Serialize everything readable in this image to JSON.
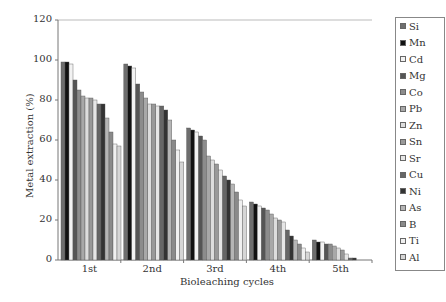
{
  "chart_data": {
    "type": "bar",
    "title": "",
    "xlabel": "Bioleaching cycles",
    "ylabel": "Metal extraction (%)",
    "ylim": [
      0,
      120
    ],
    "yticks": [
      0,
      20,
      40,
      60,
      80,
      100,
      120
    ],
    "categories": [
      "1st",
      "2nd",
      "3rd",
      "4th",
      "5th"
    ],
    "legend_position": "right",
    "series": [
      {
        "name": "Si",
        "color": "#6e6e6e",
        "values": [
          99,
          98,
          66,
          29,
          10
        ]
      },
      {
        "name": "Mn",
        "color": "#111111",
        "values": [
          99,
          97,
          65,
          28,
          9
        ]
      },
      {
        "name": "Cd",
        "color": "#f2f2f2",
        "values": [
          98,
          96,
          64,
          27,
          9
        ]
      },
      {
        "name": "Mg",
        "color": "#555555",
        "values": [
          90,
          88,
          62,
          26,
          8
        ]
      },
      {
        "name": "Co",
        "color": "#8c8c8c",
        "values": [
          85,
          84,
          60,
          25,
          8
        ]
      },
      {
        "name": "Pb",
        "color": "#a8a8a8",
        "values": [
          82,
          81,
          52,
          23,
          7
        ]
      },
      {
        "name": "Zn",
        "color": "#dddddd",
        "values": [
          81,
          78,
          50,
          21,
          6
        ]
      },
      {
        "name": "Sn",
        "color": "#999999",
        "values": [
          81,
          78,
          48,
          20,
          5
        ]
      },
      {
        "name": "Sr",
        "color": "#e6e6e6",
        "values": [
          80,
          77,
          45,
          19,
          3
        ]
      },
      {
        "name": "Cu",
        "color": "#666666",
        "values": [
          78,
          77,
          42,
          15,
          1
        ]
      },
      {
        "name": "Ni",
        "color": "#333333",
        "values": [
          78,
          75,
          40,
          12,
          1
        ]
      },
      {
        "name": "As",
        "color": "#b5b5b5",
        "values": [
          71,
          70,
          38,
          10,
          0
        ]
      },
      {
        "name": "B",
        "color": "#8a8a8a",
        "values": [
          64,
          60,
          34,
          8,
          0
        ]
      },
      {
        "name": "Ti",
        "color": "#f0f0f0",
        "values": [
          58,
          55,
          30,
          6,
          0
        ]
      },
      {
        "name": "Al",
        "color": "#d6d6d6",
        "values": [
          57,
          49,
          27,
          4,
          0
        ]
      }
    ]
  }
}
